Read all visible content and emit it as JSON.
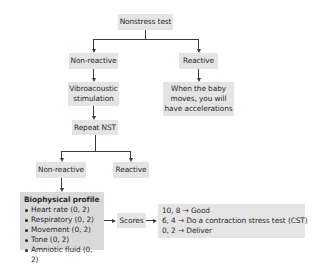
{
  "diagram": {
    "root": {
      "label": "Nonstress test"
    },
    "level1": {
      "left": {
        "label": "Non-reactive"
      },
      "right": {
        "label": "Reactive"
      }
    },
    "vibroacoustic": {
      "line1": "Vibroacoustic",
      "line2": "stimulation"
    },
    "reactive_result": {
      "line1": "When the baby",
      "line2": "moves, you will",
      "line3": "have accelerations"
    },
    "repeat": {
      "label": "Repeat NST"
    },
    "level2": {
      "left": {
        "label": "Non-reactive"
      },
      "right": {
        "label": "Reactive"
      }
    },
    "biophysical": {
      "title": "Biophysical profile",
      "items": [
        "Heart rate (0, 2)",
        "Respiratory (0, 2)",
        "Movement (0, 2)",
        "Tone (0, 2)",
        "Amniotic fluid (0, 2)"
      ]
    },
    "scores": {
      "label": "Scores"
    },
    "score_results": [
      "10, 8 → Good",
      "6, 4 → Do a contraction stress test (CST)",
      "0, 2 → Deliver"
    ]
  },
  "colors": {
    "box_fill": "#e4e4e4",
    "box_fill_dark": "#d9d9d9",
    "connector": "#3a3a3a",
    "text": "#2a2a2a"
  }
}
